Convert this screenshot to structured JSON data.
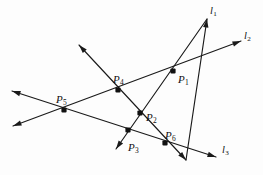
{
  "figure": {
    "background_color": "#fdfdfd",
    "stroke_color": "#1a1a1a",
    "point_color": "#111111",
    "width": 263,
    "height": 175
  },
  "points": [
    {
      "id": "P1",
      "name": "P",
      "sub": "1",
      "x": 173,
      "y": 71,
      "label_x": 178,
      "label_y": 74
    },
    {
      "id": "P2",
      "name": "P",
      "sub": "2",
      "x": 140,
      "y": 113,
      "label_x": 146,
      "label_y": 112
    },
    {
      "id": "P3",
      "name": "P",
      "sub": "3",
      "x": 128,
      "y": 130,
      "label_x": 128,
      "label_y": 142
    },
    {
      "id": "P4",
      "name": "P",
      "sub": "4",
      "x": 118,
      "y": 90,
      "label_x": 113,
      "label_y": 74
    },
    {
      "id": "P5",
      "name": "P",
      "sub": "5",
      "x": 64,
      "y": 110,
      "label_x": 56,
      "label_y": 94
    },
    {
      "id": "P6",
      "name": "P",
      "sub": "6",
      "x": 165,
      "y": 143,
      "label_x": 165,
      "label_y": 130
    }
  ],
  "lines": [
    {
      "id": "l1",
      "label": "l",
      "sub": "1",
      "label_x": 210,
      "label_y": 6,
      "x1": 186,
      "y1": 160,
      "x2": 207,
      "y2": 19,
      "arrow_start": false,
      "arrow_end": true
    },
    {
      "id": "l2",
      "label": "l",
      "sub": "2",
      "label_x": 244,
      "label_y": 31,
      "x1": 13,
      "y1": 126,
      "x2": 241,
      "y2": 41,
      "arrow_start": true,
      "arrow_end": true
    },
    {
      "id": "l3",
      "label": "l",
      "sub": "3",
      "label_x": 222,
      "label_y": 145,
      "x1": 12,
      "y1": 91,
      "x2": 216,
      "y2": 157,
      "arrow_start": true,
      "arrow_end": true
    },
    {
      "id": "l4",
      "label": "",
      "sub": "",
      "label_x": 0,
      "label_y": 0,
      "x1": 79,
      "y1": 45,
      "x2": 186,
      "y2": 160,
      "arrow_start": true,
      "arrow_end": true
    },
    {
      "id": "l5",
      "label": "",
      "sub": "",
      "label_x": 0,
      "label_y": 0,
      "x1": 116,
      "y1": 149,
      "x2": 207,
      "y2": 19,
      "arrow_start": true,
      "arrow_end": false
    }
  ]
}
